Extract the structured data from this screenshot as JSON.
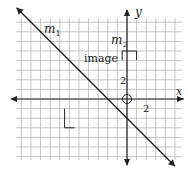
{
  "diagram": {
    "type": "coordinate-grid",
    "axes": {
      "x_label": "x",
      "y_label": "y"
    },
    "tick_labels": {
      "x_tick": "2",
      "y_tick": "2"
    },
    "grid_units": {
      "x_min": -12,
      "x_max": 5,
      "y_min": -6,
      "y_max": 8
    },
    "lines": [
      {
        "name": "m1",
        "label": "m",
        "subscript": "1",
        "slope": -1,
        "y_intercept": -2
      }
    ],
    "labels": {
      "m2_main": "m",
      "m2_sub": "2",
      "image": "image"
    },
    "marks": {
      "origin_circle": {
        "x": 0,
        "y": 0
      },
      "image_bracket": {
        "x_from": -0.5,
        "x_to": 1,
        "y": 5
      },
      "right_angle_L": {
        "x": -6.5,
        "y_from": -1,
        "y_to": -3
      }
    },
    "colors": {
      "grid": "#b8b8b8",
      "axis": "#222222",
      "line": "#222222",
      "background": "#ffffff"
    }
  }
}
